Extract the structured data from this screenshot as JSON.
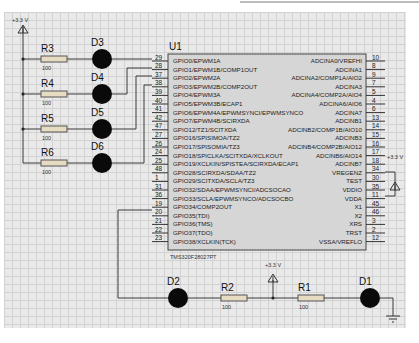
{
  "power_labels": {
    "top_left": "+3.3 V",
    "right": "+3.3 V",
    "bottom": "+3.3 V"
  },
  "chip": {
    "ref": "U1",
    "part": "TMS320F28027PT",
    "left_pins": [
      {
        "num": "29",
        "name": "GPIO0/EPWM1A"
      },
      {
        "num": "28",
        "name": "GPIO1/EPWM1B/COMP1OUT"
      },
      {
        "num": "37",
        "name": "GPIO2/EPWM2A"
      },
      {
        "num": "38",
        "name": "GPIO3/EPWM2B/COMP2OUT"
      },
      {
        "num": "39",
        "name": "GPIO4/EPWM3A"
      },
      {
        "num": "40",
        "name": "GPIO5/EPWM3B/ECAP1"
      },
      {
        "num": "41",
        "name": "GPIO6/EPWM4A/EPWMSYNCI/EPWMSYNCO"
      },
      {
        "num": "42",
        "name": "GPIO7/EPWM4B/SCIRXDA"
      },
      {
        "num": "47",
        "name": "GPIO12/TZ1/SCITXDA"
      },
      {
        "num": "27",
        "name": "GPIO16/SPISIMOA/TZ2"
      },
      {
        "num": "26",
        "name": "GPIO17/SPISOMIA/TZ3"
      },
      {
        "num": "24",
        "name": "GPIO18/SPICLKA/SCITXDA/XCLKOUT"
      },
      {
        "num": "25",
        "name": "GPIO19/XCLKIN/SPISTEA/SCIRXDA/ECAP1"
      },
      {
        "num": "48",
        "name": "GPIO28/SCIRXDA/SDAA/TZ2"
      },
      {
        "num": "1",
        "name": "GPIO29/SCITXDA/SCLA/TZ3"
      },
      {
        "num": "31",
        "name": "GPIO32/SDAA/EPWMSYNCI/ADCSOCAO"
      },
      {
        "num": "36",
        "name": "GPIO33/SCLA/EPWMSYNCO/ADCSOCBO"
      },
      {
        "num": "19",
        "name": "GPIO34/COMP2OUT"
      },
      {
        "num": "20",
        "name": "GPIO35(TDI)"
      },
      {
        "num": "21",
        "name": "GPIO36(TMS)"
      },
      {
        "num": "22",
        "name": "GPIO37(TDO)"
      },
      {
        "num": "23",
        "name": "GPIO38/XCLKIN(TCK)"
      }
    ],
    "right_pins": [
      {
        "num": "10",
        "name": "ADCINA0/VREFHI"
      },
      {
        "num": "8",
        "name": "ADCINA1"
      },
      {
        "num": "9",
        "name": "ADCINA2/COMP1A/AIO2"
      },
      {
        "num": "7",
        "name": "ADCINA3"
      },
      {
        "num": "5",
        "name": "ADCINA4/COMP2A/AIO4"
      },
      {
        "num": "4",
        "name": "ADCINA6/AIO6"
      },
      {
        "num": "6",
        "name": "ADCINA7"
      },
      {
        "num": "13",
        "name": "ADCINB1"
      },
      {
        "num": "14",
        "name": "ADCINB2/COMP1B/AIO10"
      },
      {
        "num": "15",
        "name": "ADCINB3"
      },
      {
        "num": "16",
        "name": "ADCINB4/COMP2B/AIO12"
      },
      {
        "num": "17",
        "name": "ADCINB6/AIO14"
      },
      {
        "num": "18",
        "name": "ADCINB7"
      },
      {
        "num": "34",
        "name": "VREGENZ"
      },
      {
        "num": "30",
        "name": "TEST"
      },
      {
        "num": "35",
        "name": "VDDIO"
      },
      {
        "num": "11",
        "name": "VDDA"
      },
      {
        "num": "45",
        "name": "X1"
      },
      {
        "num": "46",
        "name": "X2"
      },
      {
        "num": "3",
        "name": "XRS"
      },
      {
        "num": "2",
        "name": "TRST"
      },
      {
        "num": "12",
        "name": "VSSA/VREFLO"
      }
    ]
  },
  "resistors": [
    {
      "ref": "R3",
      "value": "100"
    },
    {
      "ref": "R4",
      "value": "100"
    },
    {
      "ref": "R5",
      "value": "100"
    },
    {
      "ref": "R6",
      "value": "100"
    },
    {
      "ref": "R2",
      "value": "100"
    },
    {
      "ref": "R1",
      "value": "100"
    }
  ],
  "leds": [
    {
      "ref": "D3"
    },
    {
      "ref": "D4"
    },
    {
      "ref": "D5"
    },
    {
      "ref": "D6"
    },
    {
      "ref": "D2"
    },
    {
      "ref": "D1"
    }
  ],
  "colors": {
    "wire": "#3a3a3a",
    "chip_fill": "#d6d6d6",
    "resistor_fill": "#e6dcc2",
    "led": "#0a0a0a"
  }
}
